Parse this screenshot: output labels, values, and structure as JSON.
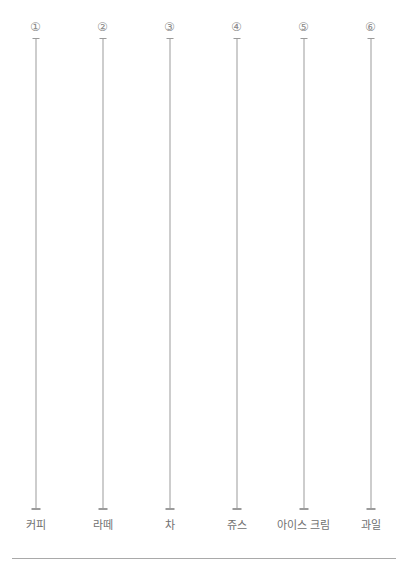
{
  "chart_data": {
    "type": "table",
    "title": "",
    "subtitle": "",
    "xlabel": "",
    "ylabel": "",
    "grid": false,
    "legend": null,
    "orientation": "vertical",
    "categories": [
      "커피",
      "라떼",
      "차",
      "쥬스",
      "아이스 크림",
      "과일"
    ],
    "index_labels": [
      "①",
      "②",
      "③",
      "④",
      "⑤",
      "⑥"
    ],
    "values": [
      null,
      null,
      null,
      null,
      null,
      null
    ],
    "series": [],
    "axis_count": 6,
    "colors": {
      "background": "#ffffff",
      "axis_line": "#9b9b9b",
      "index_text": "#8a8a8a",
      "label_text": "#6f6f6f",
      "baseline": "#a9a9a9"
    }
  },
  "columns": [
    {
      "index_label": "①",
      "category": "커피"
    },
    {
      "index_label": "②",
      "category": "라떼"
    },
    {
      "index_label": "③",
      "category": "차"
    },
    {
      "index_label": "④",
      "category": "쥬스"
    },
    {
      "index_label": "⑤",
      "category": "아이스 크림"
    },
    {
      "index_label": "⑥",
      "category": "과일"
    }
  ]
}
